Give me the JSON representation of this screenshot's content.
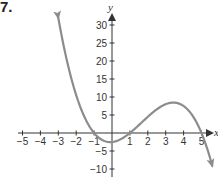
{
  "problem_number": "7.",
  "colors": {
    "curve": "#8c8c8c",
    "axis": "#333333"
  },
  "chart_data": {
    "type": "line",
    "title": "",
    "xlabel": "x",
    "ylabel": "y",
    "xlim": [
      -5,
      5
    ],
    "ylim": [
      -10,
      30
    ],
    "x_ticks": [
      -5,
      -4,
      -3,
      -2,
      -1,
      1,
      2,
      3,
      4,
      5
    ],
    "y_ticks": [
      -10,
      -5,
      5,
      10,
      15,
      20,
      25,
      30
    ],
    "x_tick_labels": [
      "−5",
      "−4",
      "−3",
      "−2",
      "−1",
      "1",
      "2",
      "3",
      "4",
      "5"
    ],
    "y_tick_labels": [
      "−10",
      "−5",
      "5",
      "10",
      "15",
      "20",
      "25",
      "30"
    ],
    "grid": false,
    "legend": null,
    "series": [
      {
        "name": "f(x) = -0.5(x+1)(x-1)(x-5)",
        "x": [
          -3,
          -2.5,
          -2,
          -1.5,
          -1,
          -0.5,
          0,
          0.5,
          1,
          1.5,
          2,
          2.5,
          3,
          3.4,
          4,
          4.5,
          5,
          5.6
        ],
        "values": [
          32,
          18.4,
          10.5,
          4.4,
          0,
          -2.1,
          -2.5,
          -1.7,
          0,
          2.2,
          4.5,
          6.6,
          8,
          8.4,
          7.5,
          5.4,
          0,
          -9.1
        ],
        "arrows": "both ends"
      }
    ],
    "roots": [
      -1,
      1,
      5
    ],
    "local_min": {
      "x": 0,
      "y": -2.5
    },
    "local_max": {
      "x": 3.4,
      "y": 8.4
    }
  }
}
